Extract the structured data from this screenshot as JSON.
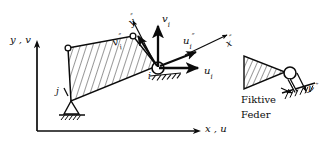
{
  "figure": {
    "type": "structural-mechanics-diagram",
    "background_color": "#ffffff",
    "ink_color": "#0b0b0b",
    "width": 330,
    "height": 149
  },
  "global_axes": {
    "vertical_label": "y , v",
    "horizontal_label": "x , u",
    "origin_x": 37,
    "origin_y": 131
  },
  "local_axes": {
    "x_label": "x",
    "x_prime": "″",
    "y_label": "y",
    "y_prime": "″"
  },
  "nodes": {
    "i_label": "i",
    "j_label": "j"
  },
  "vectors": [
    {
      "name": "u-i",
      "base": "u",
      "sub": "i",
      "prime": ""
    },
    {
      "name": "v-i",
      "base": "v",
      "sub": "i",
      "prime": ""
    },
    {
      "name": "u-i-double",
      "base": "u",
      "sub": "i",
      "prime": "″"
    },
    {
      "name": "v-i-double",
      "base": "v",
      "sub": "i",
      "prime": "″"
    }
  ],
  "labels": {
    "u_i": "u",
    "v_i": "v",
    "u_i_pp": "u",
    "v_i_pp": "v",
    "sub_i": "i",
    "dprime": "″",
    "x_axis_local": "x",
    "y_axis_local": "y",
    "y_axis_local_detail": "y"
  },
  "detail": {
    "caption_line1": "Fiktive",
    "caption_line2": "Feder",
    "spring_axis_label": "y",
    "spring_axis_prime": "″"
  }
}
